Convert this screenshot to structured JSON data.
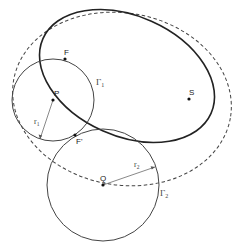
{
  "diagram": {
    "type": "geometric-construction",
    "colors": {
      "background": "#ffffff",
      "stroke": "#333333",
      "thin_stroke": "#555555",
      "point": "#111111"
    },
    "points": {
      "F": {
        "label": "F",
        "x": 65,
        "y": 59
      },
      "P": {
        "label": "P",
        "x": 53,
        "y": 100
      },
      "Fp": {
        "label": "F'",
        "x": 75,
        "y": 135
      },
      "S": {
        "label": "S",
        "x": 189,
        "y": 99
      },
      "Q": {
        "label": "Q",
        "x": 103,
        "y": 185
      }
    },
    "circles": {
      "gamma1": {
        "label": "Γ",
        "subscript": "1",
        "cx": 53,
        "cy": 100,
        "r": 41
      },
      "gamma2": {
        "label": "Γ",
        "subscript": "2",
        "cx": 103,
        "cy": 185,
        "r": 56
      }
    },
    "radii": {
      "r1": {
        "label": "r",
        "subscript": "1"
      },
      "r2": {
        "label": "r",
        "subscript": "2"
      }
    },
    "ellipses": {
      "solid": {
        "style": "solid-thick",
        "cx": 127,
        "cy": 76,
        "rx": 92,
        "ry": 60,
        "rotation": 24
      },
      "dashed": {
        "style": "dashed",
        "cx": 122,
        "cy": 99,
        "rx": 110,
        "ry": 86,
        "rotation": 10
      }
    }
  }
}
